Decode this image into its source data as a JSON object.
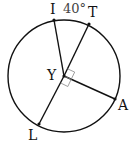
{
  "diagram": {
    "type": "circle-with-radii",
    "center": {
      "label": "Y",
      "x": 64,
      "y": 74
    },
    "radius": 57,
    "points": [
      {
        "label": "I",
        "x": 54,
        "y": 18
      },
      {
        "label": "T",
        "x": 89,
        "y": 23
      },
      {
        "label": "A",
        "x": 115,
        "y": 99
      },
      {
        "label": "L",
        "x": 39,
        "y": 125
      }
    ],
    "angle_label": "40°",
    "right_angle_between": [
      "T",
      "A"
    ],
    "colors": {
      "stroke": "#111111",
      "marker": "#888888"
    }
  },
  "labels": {
    "I": "I",
    "T": "T",
    "A": "A",
    "L": "L",
    "Y": "Y",
    "angle": "40°"
  }
}
